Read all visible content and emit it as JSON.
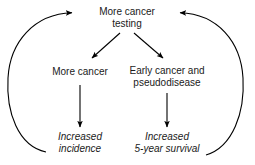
{
  "diagram": {
    "background_color": "#ffffff",
    "line_color": "#000000",
    "nodes": {
      "top": {
        "id": "more-cancer-testing",
        "line1": "More cancer",
        "line2": "testing",
        "style": "regular"
      },
      "left_mid": {
        "id": "more-cancer",
        "line1": "More cancer",
        "line2": "",
        "style": "regular"
      },
      "right_mid": {
        "id": "early-cancer-and-pseudodisease",
        "line1": "Early cancer and",
        "line2": "pseudodisease",
        "style": "regular"
      },
      "left_bottom": {
        "id": "increased-incidence",
        "line1": "Increased",
        "line2": "incidence",
        "style": "italic"
      },
      "right_bottom": {
        "id": "increased-5-year-survival",
        "line1": "Increased",
        "line2": "5-year survival",
        "style": "italic"
      }
    },
    "edges": [
      {
        "id": "fork-left",
        "from": "more-cancer-testing",
        "to": "more-cancer",
        "kind": "diagonal-arrow"
      },
      {
        "id": "fork-right",
        "from": "more-cancer-testing",
        "to": "early-cancer-and-pseudodisease",
        "kind": "diagonal-arrow"
      },
      {
        "id": "down-left",
        "from": "more-cancer",
        "to": "increased-incidence",
        "kind": "vertical-arrow"
      },
      {
        "id": "down-right",
        "from": "early-cancer-and-pseudodisease",
        "to": "increased-5-year-survival",
        "kind": "vertical-arrow"
      },
      {
        "id": "feedback-left",
        "from": "increased-incidence",
        "to": "more-cancer-testing",
        "kind": "curved-arrow"
      },
      {
        "id": "feedback-right",
        "from": "increased-5-year-survival",
        "to": "more-cancer-testing",
        "kind": "curved-arrow"
      }
    ]
  }
}
